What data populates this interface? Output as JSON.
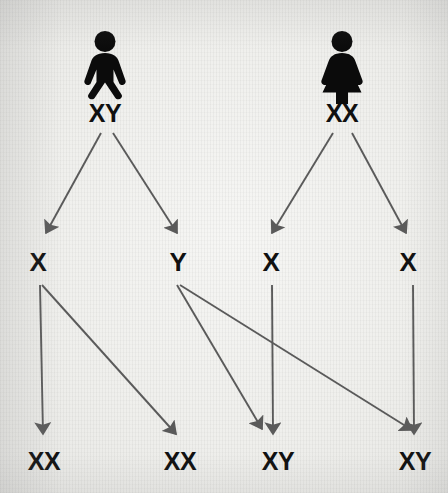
{
  "diagram": {
    "background_color": "#efefec",
    "ink_color": "#101010",
    "arrow_color": "#5a5a5a",
    "parents": [
      {
        "id": "father",
        "icon": "male-figure-icon",
        "sex": "male",
        "genotype": "XY",
        "x": 105,
        "y": 113
      },
      {
        "id": "mother",
        "icon": "female-figure-icon",
        "sex": "female",
        "genotype": "XX",
        "x": 342,
        "y": 113
      }
    ],
    "gametes": [
      {
        "id": "gamete-1",
        "label": "X",
        "from": "father",
        "x": 38,
        "y": 262
      },
      {
        "id": "gamete-2",
        "label": "Y",
        "from": "father",
        "x": 178,
        "y": 262
      },
      {
        "id": "gamete-3",
        "label": "X",
        "from": "mother",
        "x": 271,
        "y": 262
      },
      {
        "id": "gamete-4",
        "label": "X",
        "from": "mother",
        "x": 408,
        "y": 262
      }
    ],
    "offspring": [
      {
        "id": "offspring-1",
        "label": "XX",
        "sex": "female",
        "x": 44,
        "y": 461
      },
      {
        "id": "offspring-2",
        "label": "XX",
        "sex": "female",
        "x": 180,
        "y": 461
      },
      {
        "id": "offspring-3",
        "label": "XY",
        "sex": "male",
        "x": 278,
        "y": 461
      },
      {
        "id": "offspring-4",
        "label": "XY",
        "sex": "male",
        "x": 415,
        "y": 461
      }
    ],
    "arrows": [
      {
        "id": "arrow-father-to-gamete-1",
        "from": "father",
        "to": "gamete-1",
        "x1": 101,
        "y1": 133,
        "x2": 46,
        "y2": 233
      },
      {
        "id": "arrow-father-to-gamete-2",
        "from": "father",
        "to": "gamete-2",
        "x1": 113,
        "y1": 133,
        "x2": 177,
        "y2": 233
      },
      {
        "id": "arrow-mother-to-gamete-3",
        "from": "mother",
        "to": "gamete-3",
        "x1": 333,
        "y1": 133,
        "x2": 272,
        "y2": 233
      },
      {
        "id": "arrow-mother-to-gamete-4",
        "from": "mother",
        "to": "gamete-4",
        "x1": 352,
        "y1": 133,
        "x2": 406,
        "y2": 233
      },
      {
        "id": "arrow-gamete-1-to-offspring-1",
        "from": "gamete-1",
        "to": "offspring-1",
        "x1": 40,
        "y1": 285,
        "x2": 43,
        "y2": 434
      },
      {
        "id": "arrow-gamete-1-to-offspring-2",
        "from": "gamete-1",
        "to": "offspring-2",
        "x1": 42,
        "y1": 285,
        "x2": 176,
        "y2": 434
      },
      {
        "id": "arrow-gamete-2-to-offspring-3",
        "from": "gamete-2",
        "to": "offspring-3",
        "x1": 177,
        "y1": 285,
        "x2": 262,
        "y2": 429
      },
      {
        "id": "arrow-gamete-2-to-offspring-4",
        "from": "gamete-2",
        "to": "offspring-4",
        "x1": 180,
        "y1": 285,
        "x2": 412,
        "y2": 430
      },
      {
        "id": "arrow-gamete-3-to-offspring-3",
        "from": "gamete-3",
        "to": "offspring-3",
        "x1": 272,
        "y1": 285,
        "x2": 273,
        "y2": 434
      },
      {
        "id": "arrow-gamete-4-to-offspring-4",
        "from": "gamete-4",
        "to": "offspring-4",
        "x1": 413,
        "y1": 285,
        "x2": 414,
        "y2": 434
      }
    ]
  }
}
